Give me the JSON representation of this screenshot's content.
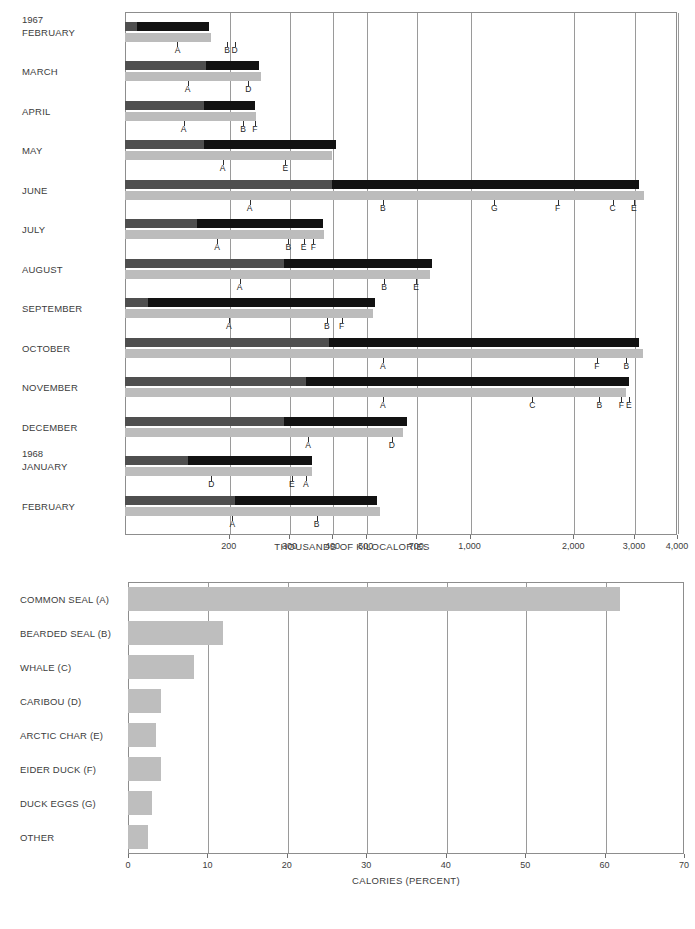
{
  "chart_data": [
    {
      "type": "bar",
      "title": "",
      "xlabel": "THOUSANDS OF KILOCALORIES",
      "ylabel": "",
      "scale": "log",
      "xlim": [
        100,
        4000
      ],
      "xticks": [
        200,
        300,
        400,
        500,
        700,
        1000,
        2000,
        3000,
        4000
      ],
      "xticklabels": [
        "200",
        "300",
        "400",
        "500",
        "700",
        "1,000",
        "2,000",
        "3,000",
        "4,000"
      ],
      "grid": "vertical",
      "legend": "none",
      "categories": [
        "FEBRUARY",
        "MARCH",
        "APRIL",
        "MAY",
        "JUNE",
        "JULY",
        "AUGUST",
        "SEPTEMBER",
        "OCTOBER",
        "NOVEMBER",
        "DECEMBER",
        "JANUARY",
        "FEBRUARY"
      ],
      "year_markers": [
        {
          "label": "1967",
          "category_index": 0
        },
        {
          "label": "1968",
          "category_index": 11
        }
      ],
      "series": [
        {
          "name": "total kilocalories (black bar)",
          "values": [
            175,
            245,
            238,
            410,
            3100,
            375,
            780,
            530,
            3100,
            2900,
            660,
            350,
            540
          ]
        },
        {
          "name": "common seal portion (dark grey segment)",
          "values": [
            108,
            172,
            170,
            170,
            400,
            162,
            290,
            117,
            390,
            335,
            290,
            152,
            208
          ]
        },
        {
          "name": "cumulative percent bar (light grey)",
          "values": [
            178,
            248,
            240,
            400,
            3200,
            378,
            770,
            525,
            3180,
            2850,
            640,
            350,
            548
          ]
        }
      ],
      "cumulative_markers": [
        {
          "category": "FEBRUARY",
          "marks": [
            {
              "letter": "A",
              "value": 142
            },
            {
              "letter": "B",
              "value": 198
            },
            {
              "letter": "D",
              "value": 208
            }
          ]
        },
        {
          "category": "MARCH",
          "marks": [
            {
              "letter": "A",
              "value": 152
            },
            {
              "letter": "D",
              "value": 228
            }
          ]
        },
        {
          "category": "APRIL",
          "marks": [
            {
              "letter": "A",
              "value": 148
            },
            {
              "letter": "B",
              "value": 220
            },
            {
              "letter": "F",
              "value": 238
            }
          ]
        },
        {
          "category": "MAY",
          "marks": [
            {
              "letter": "A",
              "value": 192
            },
            {
              "letter": "E",
              "value": 292
            }
          ]
        },
        {
          "category": "JUNE",
          "marks": [
            {
              "letter": "A",
              "value": 230
            },
            {
              "letter": "B",
              "value": 560
            },
            {
              "letter": "G",
              "value": 1180
            },
            {
              "letter": "F",
              "value": 1800
            },
            {
              "letter": "C",
              "value": 2600
            },
            {
              "letter": "E",
              "value": 3000
            }
          ]
        },
        {
          "category": "JULY",
          "marks": [
            {
              "letter": "A",
              "value": 185
            },
            {
              "letter": "B",
              "value": 298
            },
            {
              "letter": "E",
              "value": 330
            },
            {
              "letter": "F",
              "value": 352
            }
          ]
        },
        {
          "category": "AUGUST",
          "marks": [
            {
              "letter": "A",
              "value": 215
            },
            {
              "letter": "B",
              "value": 565
            },
            {
              "letter": "E",
              "value": 700
            }
          ]
        },
        {
          "category": "SEPTEMBER",
          "marks": [
            {
              "letter": "A",
              "value": 200
            },
            {
              "letter": "B",
              "value": 385
            },
            {
              "letter": "F",
              "value": 425
            }
          ]
        },
        {
          "category": "OCTOBER",
          "marks": [
            {
              "letter": "A",
              "value": 560
            },
            {
              "letter": "F",
              "value": 2340
            },
            {
              "letter": "B",
              "value": 2850
            }
          ]
        },
        {
          "category": "NOVEMBER",
          "marks": [
            {
              "letter": "A",
              "value": 560
            },
            {
              "letter": "C",
              "value": 1520
            },
            {
              "letter": "B",
              "value": 2380
            },
            {
              "letter": "F",
              "value": 2760
            },
            {
              "letter": "E",
              "value": 2900
            }
          ]
        },
        {
          "category": "DECEMBER",
          "marks": [
            {
              "letter": "A",
              "value": 340
            },
            {
              "letter": "D",
              "value": 595
            }
          ]
        },
        {
          "category": "JANUARY",
          "marks": [
            {
              "letter": "D",
              "value": 178
            },
            {
              "letter": "E",
              "value": 305
            },
            {
              "letter": "A",
              "value": 335
            }
          ]
        },
        {
          "category": "FEBRUARY",
          "marks": [
            {
              "letter": "A",
              "value": 205
            },
            {
              "letter": "B",
              "value": 360
            }
          ]
        }
      ]
    },
    {
      "type": "bar",
      "title": "",
      "xlabel": "CALORIES  (PERCENT)",
      "ylabel": "",
      "scale": "linear",
      "xlim": [
        0,
        70
      ],
      "xticks": [
        0,
        10,
        20,
        30,
        40,
        50,
        60,
        70
      ],
      "xticklabels": [
        "0",
        "10",
        "20",
        "30",
        "40",
        "50",
        "60",
        "70"
      ],
      "grid": "vertical",
      "legend": "none",
      "categories": [
        "COMMON SEAL (A)",
        "BEARDED SEAL (B)",
        "WHALE (C)",
        "CARIBOU (D)",
        "ARCTIC CHAR (E)",
        "EIDER DUCK (F)",
        "DUCK EGGS (G)",
        "OTHER"
      ],
      "values": [
        62,
        12,
        8.3,
        4.2,
        3.5,
        4.2,
        3,
        2.5
      ]
    }
  ],
  "colors": {
    "bar_total": "#121212",
    "bar_dark": "#4f4f4f",
    "bar_gray": "#bcbcbc",
    "grid": "#9a9a9a",
    "text": "#3c3c3c"
  }
}
